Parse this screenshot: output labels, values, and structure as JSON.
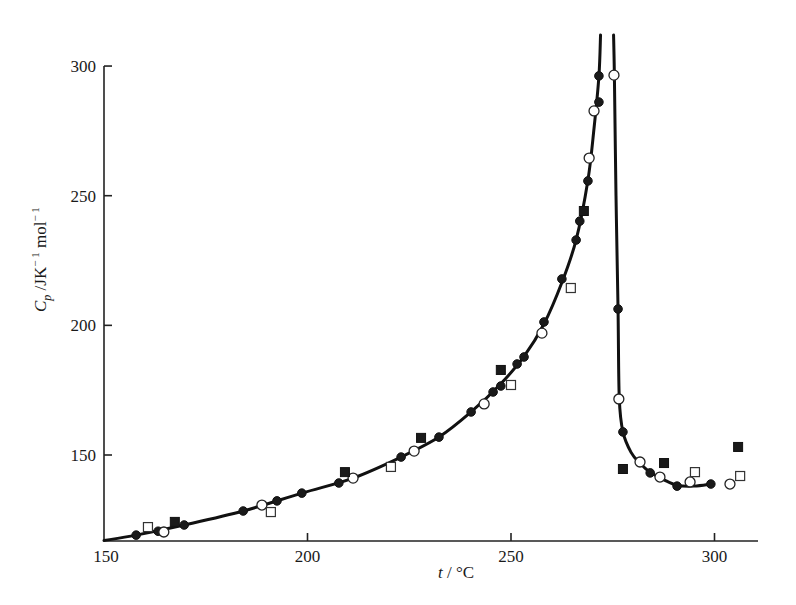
{
  "chart_data": {
    "type": "scatter",
    "title": "",
    "xlabel": "t / °C",
    "ylabel": "C_p /JK⁻¹ mol⁻¹",
    "xlim": [
      150,
      311
    ],
    "ylim": [
      117,
      312
    ],
    "x_ticks": [
      150,
      200,
      250,
      300
    ],
    "y_ticks": [
      150,
      200,
      250,
      300
    ],
    "grid": false,
    "legend": null,
    "annotations": [],
    "series": [
      {
        "name": "filled-circles",
        "marker": "filled-circle",
        "points": [
          [
            157.9,
            119.1
          ],
          [
            163.3,
            120.6
          ],
          [
            169.7,
            123.0
          ],
          [
            184.2,
            128.4
          ],
          [
            192.5,
            132.3
          ],
          [
            198.6,
            135.3
          ],
          [
            207.7,
            139.2
          ],
          [
            223.0,
            149.2
          ],
          [
            232.3,
            156.9
          ],
          [
            240.2,
            166.6
          ],
          [
            245.6,
            174.3
          ],
          [
            247.5,
            176.6
          ],
          [
            251.5,
            185.1
          ],
          [
            253.2,
            187.8
          ],
          [
            258.1,
            201.3
          ],
          [
            262.5,
            217.9
          ],
          [
            266.0,
            232.9
          ],
          [
            266.9,
            240.2
          ],
          [
            268.9,
            255.7
          ],
          [
            271.6,
            286.1
          ],
          [
            271.6,
            296.2
          ],
          [
            276.3,
            206.3
          ],
          [
            277.5,
            158.9
          ],
          [
            284.2,
            143.1
          ],
          [
            290.8,
            138.0
          ],
          [
            299.1,
            138.8
          ]
        ]
      },
      {
        "name": "open-circles",
        "marker": "open-circle",
        "points": [
          [
            164.7,
            120.3
          ],
          [
            188.8,
            130.7
          ],
          [
            211.2,
            141.1
          ],
          [
            226.2,
            151.5
          ],
          [
            243.4,
            169.7
          ],
          [
            257.6,
            197.0
          ],
          [
            269.2,
            264.5
          ],
          [
            270.4,
            282.7
          ],
          [
            275.3,
            296.5
          ],
          [
            276.5,
            171.6
          ],
          [
            281.7,
            147.3
          ],
          [
            286.6,
            141.5
          ],
          [
            294.0,
            139.6
          ],
          [
            303.8,
            138.8
          ]
        ]
      },
      {
        "name": "open-squares",
        "marker": "open-square",
        "points": [
          [
            160.8,
            122.2
          ],
          [
            191.0,
            128.0
          ],
          [
            220.5,
            145.4
          ],
          [
            250.0,
            177.0
          ],
          [
            264.7,
            214.4
          ],
          [
            295.2,
            143.4
          ],
          [
            306.3,
            141.9
          ]
        ]
      },
      {
        "name": "filled-squares",
        "marker": "filled-square",
        "points": [
          [
            167.4,
            124.2
          ],
          [
            209.2,
            143.4
          ],
          [
            227.9,
            156.6
          ],
          [
            247.5,
            182.8
          ],
          [
            267.9,
            244.1
          ],
          [
            277.5,
            144.6
          ],
          [
            287.6,
            146.9
          ],
          [
            305.8,
            153.1
          ]
        ]
      }
    ],
    "fitted_curve": {
      "left_branch": [
        [
          150,
          117
        ],
        [
          157.9,
          119.1
        ],
        [
          169.7,
          123.0
        ],
        [
          184.2,
          128.4
        ],
        [
          198.6,
          135.3
        ],
        [
          211.2,
          141.1
        ],
        [
          223.0,
          149.2
        ],
        [
          232.3,
          156.9
        ],
        [
          240.2,
          166.6
        ],
        [
          247.5,
          177.5
        ],
        [
          253.2,
          188.0
        ],
        [
          258.1,
          200.5
        ],
        [
          262.5,
          216.5
        ],
        [
          266.0,
          233.0
        ],
        [
          268.9,
          256.0
        ],
        [
          270.4,
          276.0
        ],
        [
          271.6,
          296.0
        ],
        [
          272.0,
          312.0
        ]
      ],
      "right_branch": [
        [
          275.2,
          312.0
        ],
        [
          275.4,
          296.5
        ],
        [
          275.8,
          250.0
        ],
        [
          276.3,
          206.3
        ],
        [
          276.6,
          172.0
        ],
        [
          277.5,
          158.9
        ],
        [
          279.5,
          151.0
        ],
        [
          281.7,
          146.8
        ],
        [
          284.2,
          143.3
        ],
        [
          287.5,
          140.5
        ],
        [
          290.8,
          138.3
        ],
        [
          295.0,
          138.0
        ],
        [
          299.1,
          138.8
        ]
      ]
    }
  },
  "axes": {
    "x_tick_labels": [
      "150",
      "200",
      "250",
      "300"
    ],
    "y_tick_labels": [
      "150",
      "200",
      "250",
      "300"
    ],
    "x_label_var": "t",
    "x_label_unit": " / °C",
    "y_label_var": "C",
    "y_label_sub": "p",
    "y_label_unit": " /JK",
    "y_label_exp1": "− 1",
    "y_label_mol": " mol",
    "y_label_exp2": "− 1"
  }
}
